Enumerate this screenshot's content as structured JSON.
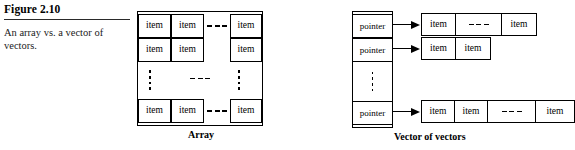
{
  "caption": {
    "figure_number": "Figure 2.10",
    "text": "An array vs. a vector of vectors."
  },
  "array_figure": {
    "label": "Array",
    "cell_text": "item",
    "rows": [
      {
        "left_cells": [
          "item",
          "item"
        ],
        "gap": "dashes",
        "right_cells": [
          "item"
        ]
      },
      {
        "left_cells": [
          "item",
          "item"
        ],
        "gap": "blank",
        "right_cells": [
          "item"
        ]
      },
      {
        "left_cells": [],
        "gap": "vertical-dots-and-dashes",
        "right_cells": []
      },
      {
        "left_cells": [
          "item",
          "item"
        ],
        "gap": "dashes",
        "right_cells": [
          "item"
        ]
      }
    ]
  },
  "vector_of_vectors_figure": {
    "label": "Vector of vectors",
    "pointer_text": "pointer",
    "cell_text": "item",
    "pointer_cells": [
      "pointer",
      "pointer",
      "vertical-dots",
      "pointer"
    ],
    "vectors": [
      {
        "cells": [
          "item",
          "dashes",
          "item"
        ]
      },
      {
        "cells": [
          "item",
          "item"
        ]
      },
      {
        "cells": [
          "item",
          "item",
          "dashes",
          "item"
        ]
      }
    ]
  },
  "colors": {
    "ink": "#000000",
    "background": "#ffffff",
    "rule": "#2a2a2a"
  }
}
